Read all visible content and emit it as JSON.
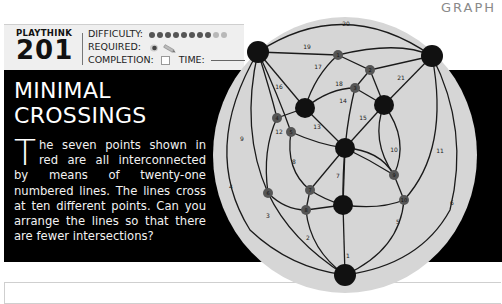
{
  "header": {
    "section_label": "GRAPH"
  },
  "info": {
    "playthink_label": "PLAYTHINK",
    "playthink_number": "201",
    "difficulty_label": "DIFFICULTY:",
    "difficulty_level": 8,
    "difficulty_max": 10,
    "required_label": "REQUIRED:",
    "required_items": [
      "eye-icon",
      "pencil-icon"
    ],
    "completion_label": "COMPLETION:",
    "time_label": "TIME:"
  },
  "puzzle": {
    "title_line1": "MINIMAL",
    "title_line2": "CROSSINGS",
    "dropcap": "T",
    "body": "he seven points shown in red are all interconnected by means of twenty-one numbered lines. The lines cross at ten different points. Can you arrange the lines so that there are fewer intersections?"
  },
  "graph": {
    "main_nodes": 7,
    "crossings": [
      "1",
      "2",
      "3",
      "4",
      "5",
      "6",
      "7",
      "8",
      "9",
      "10"
    ],
    "edge_labels": [
      "1",
      "2",
      "3",
      "4",
      "5",
      "6",
      "7",
      "8",
      "9",
      "10",
      "11",
      "12",
      "13",
      "14",
      "15",
      "16",
      "17",
      "18",
      "19",
      "20",
      "21"
    ],
    "colors": {
      "disc": "#d6d6d6",
      "node": "#111111",
      "crossing": "#555555",
      "line": "#1a1a1a"
    }
  }
}
